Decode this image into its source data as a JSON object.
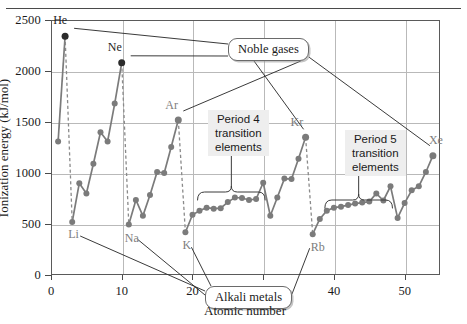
{
  "figure": {
    "top_rule": true,
    "x_axis_label": "Atomic number",
    "y_axis_label": "Ionization energy (kJ/mol)"
  },
  "callouts": [
    {
      "id": "noble-gases",
      "label": "Noble gases"
    },
    {
      "id": "alkali-metals",
      "label": "Alkali metals"
    }
  ],
  "blocks": [
    {
      "id": "period-4",
      "line1": "Period 4",
      "line2": "transition",
      "line3": "elements"
    },
    {
      "id": "period-5",
      "line1": "Period 5",
      "line2": "transition",
      "line3": "elements"
    }
  ],
  "point_labels": [
    {
      "text": "He",
      "z": 2,
      "tone": "dark"
    },
    {
      "text": "Ne",
      "z": 10,
      "tone": "dark"
    },
    {
      "text": "Ar",
      "z": 18,
      "tone": "grey"
    },
    {
      "text": "Kr",
      "z": 36,
      "tone": "grey"
    },
    {
      "text": "Xe",
      "z": 54,
      "tone": "grey"
    },
    {
      "text": "Li",
      "z": 3,
      "tone": "grey"
    },
    {
      "text": "Na",
      "z": 11,
      "tone": "grey"
    },
    {
      "text": "K",
      "z": 19,
      "tone": "grey"
    },
    {
      "text": "Rb",
      "z": 37,
      "tone": "grey"
    }
  ],
  "colors": {
    "line": "#7b7b7b",
    "marker": "#7b7b7b",
    "marker_dark": "#2b2b2b",
    "grid": "#b9b9b9",
    "axis": "#5a5a5a",
    "block_bg": "#eeeeee",
    "label_grey": "#7d7d7d"
  },
  "chart_data": {
    "type": "line",
    "title": "",
    "subtitle": "",
    "xlabel": "Atomic number",
    "ylabel": "Ionization energy (kJ/mol)",
    "xlim": [
      0,
      55
    ],
    "ylim": [
      0,
      2500
    ],
    "xticks": [
      0,
      10,
      20,
      30,
      40,
      50
    ],
    "yticks": [
      0,
      500,
      1000,
      1500,
      2000,
      2500
    ],
    "grid": true,
    "legend": "none",
    "marker": "filled-circle",
    "series": [
      {
        "name": "First ionization energy",
        "x": [
          1,
          2,
          3,
          4,
          5,
          6,
          7,
          8,
          9,
          10,
          11,
          12,
          13,
          14,
          15,
          16,
          17,
          18,
          19,
          20,
          21,
          22,
          23,
          24,
          25,
          26,
          27,
          28,
          29,
          30,
          31,
          32,
          33,
          34,
          35,
          36,
          37,
          38,
          39,
          40,
          41,
          42,
          43,
          44,
          45,
          46,
          47,
          48,
          49,
          50,
          51,
          52,
          53,
          54
        ],
        "values": [
          1310,
          2340,
          520,
          900,
          800,
          1090,
          1400,
          1310,
          1680,
          2080,
          495,
          735,
          580,
          785,
          1010,
          1000,
          1255,
          1520,
          420,
          590,
          630,
          660,
          650,
          655,
          715,
          760,
          755,
          735,
          745,
          905,
          580,
          760,
          945,
          940,
          1140,
          1350,
          400,
          550,
          630,
          660,
          670,
          685,
          700,
          710,
          720,
          800,
          730,
          870,
          560,
          705,
          830,
          870,
          1010,
          1170
        ]
      }
    ],
    "noble_gas_points": [
      {
        "element": "He",
        "z": 2,
        "value": 2340
      },
      {
        "element": "Ne",
        "z": 10,
        "value": 2080
      },
      {
        "element": "Ar",
        "z": 18,
        "value": 1520
      },
      {
        "element": "Kr",
        "z": 36,
        "value": 1350
      },
      {
        "element": "Xe",
        "z": 54,
        "value": 1170
      }
    ],
    "alkali_metal_points": [
      {
        "element": "Li",
        "z": 3,
        "value": 520
      },
      {
        "element": "Na",
        "z": 11,
        "value": 495
      },
      {
        "element": "K",
        "z": 19,
        "value": 420
      },
      {
        "element": "Rb",
        "z": 37,
        "value": 400
      }
    ],
    "period_brackets": [
      {
        "label": "Period 4 transition elements",
        "z_start": 21,
        "z_end": 30
      },
      {
        "label": "Period 5 transition elements",
        "z_start": 39,
        "z_end": 48
      }
    ],
    "vertical_dropline_elements": [
      "He",
      "Ne",
      "Ar",
      "Kr"
    ]
  }
}
